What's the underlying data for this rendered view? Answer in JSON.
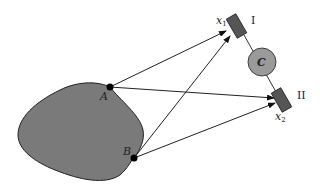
{
  "diagram": {
    "type": "source-detector geometry",
    "source_region": {
      "fill": "#7a7a7a",
      "stroke": "#222222"
    },
    "points": [
      {
        "id": "A",
        "label": "A",
        "x": 110,
        "y": 87
      },
      {
        "id": "B",
        "label": "B",
        "x": 134,
        "y": 158
      }
    ],
    "detectors": [
      {
        "id": "I",
        "roman_label": "I",
        "position_label": "x",
        "position_sub": "1",
        "fill": "#555555"
      },
      {
        "id": "II",
        "roman_label": "II",
        "position_label": "x",
        "position_sub": "2",
        "fill": "#555555"
      }
    ],
    "correlator": {
      "label": "C",
      "fill": "#9a9a9a"
    },
    "arrows": [
      {
        "from": "A",
        "to": "I"
      },
      {
        "from": "A",
        "to": "II"
      },
      {
        "from": "B",
        "to": "I"
      },
      {
        "from": "B",
        "to": "II"
      }
    ]
  }
}
